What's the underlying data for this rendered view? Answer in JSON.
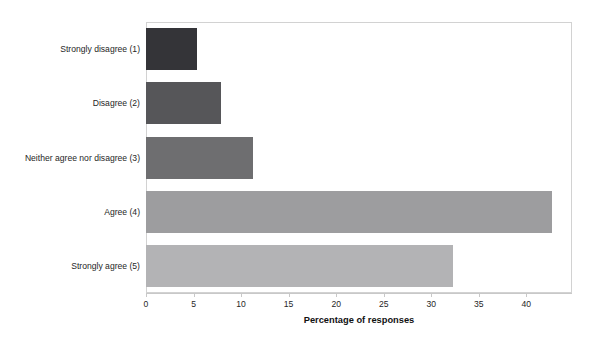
{
  "chart_data": {
    "type": "bar",
    "orientation": "horizontal",
    "title": "",
    "xlabel": "Percentage of responses",
    "ylabel": "",
    "categories": [
      "Strongly disagree (1)",
      "Disagree (2)",
      "Neither agree nor disagree (3)",
      "Agree (4)",
      "Strongly agree (5)"
    ],
    "values": [
      5.4,
      7.9,
      11.2,
      42.7,
      32.3
    ],
    "bar_colors": [
      "#343438",
      "#565659",
      "#6e6e70",
      "#9d9d9f",
      "#b3b3b5"
    ],
    "xlim": [
      0,
      44.8
    ],
    "xticks": [
      0,
      5,
      10,
      15,
      20,
      25,
      30,
      35,
      40
    ],
    "xtick_labels": [
      "0",
      "5",
      "10",
      "15",
      "20",
      "25",
      "30",
      "35",
      "40"
    ],
    "grid": false,
    "legend": false,
    "plot_border_color": "#d2d2d2",
    "axis_color": "#c8c8c8"
  }
}
